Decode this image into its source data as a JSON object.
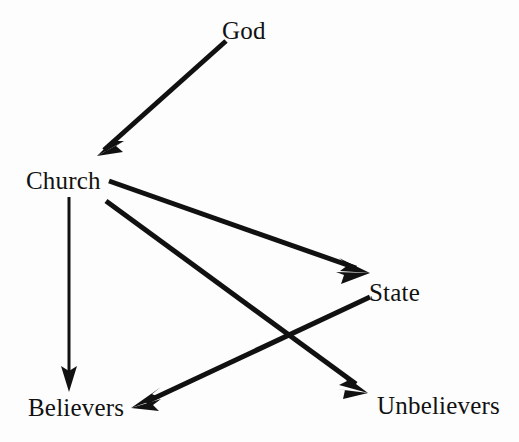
{
  "diagram": {
    "background_color": "#fdfdfd",
    "ink_color": "#111111",
    "nodes": [
      {
        "id": "god",
        "label": "God",
        "x": 253,
        "y": 31
      },
      {
        "id": "church",
        "label": "Church",
        "x": 66,
        "y": 181
      },
      {
        "id": "state",
        "label": "State",
        "x": 397,
        "y": 293
      },
      {
        "id": "believers",
        "label": "Believers",
        "x": 75,
        "y": 408
      },
      {
        "id": "unbelievers",
        "label": "Unbelievers",
        "x": 436,
        "y": 406
      }
    ],
    "edges": [
      {
        "id": "god-to-church",
        "from": "God",
        "to": "Church",
        "x1": 226,
        "y1": 41,
        "x2": 97,
        "y2": 156,
        "stroke_width": 5,
        "arrowhead": "filled-barbed"
      },
      {
        "id": "church-to-believers",
        "from": "Church",
        "to": "Believers",
        "x1": 69,
        "y1": 197,
        "x2": 69,
        "y2": 391,
        "stroke_width": 3,
        "arrowhead": "filled-barbed"
      },
      {
        "id": "church-to-state",
        "from": "Church",
        "to": "State",
        "x1": 109,
        "y1": 181,
        "x2": 370,
        "y2": 273,
        "stroke_width": 5,
        "arrowhead": "filled-barbed"
      },
      {
        "id": "church-to-unbelievers",
        "from": "Church",
        "to": "Unbelievers",
        "x1": 106,
        "y1": 201,
        "x2": 368,
        "y2": 393,
        "stroke_width": 5,
        "arrowhead": "filled-barbed"
      },
      {
        "id": "state-to-believers",
        "from": "State",
        "to": "Believers",
        "x1": 370,
        "y1": 297,
        "x2": 131,
        "y2": 408,
        "stroke_width": 5,
        "arrowhead": "filled-barbed"
      }
    ]
  }
}
